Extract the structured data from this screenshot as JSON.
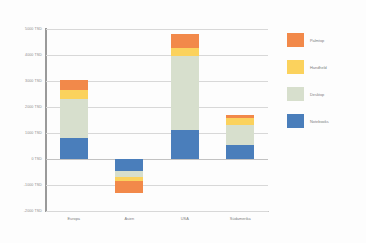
{
  "chart_data": {
    "type": "bar",
    "stacked": true,
    "title": "",
    "xlabel": "",
    "ylabel": "",
    "categories": [
      "Europa",
      "Asien",
      "USA",
      "Südamerika"
    ],
    "series": [
      {
        "name": "Notebooks",
        "color": "#4a7ebb",
        "values": [
          800,
          -450,
          1100,
          550
        ]
      },
      {
        "name": "Desktop",
        "color": "#d7dfcd",
        "values": [
          1500,
          -250,
          2850,
          750
        ]
      },
      {
        "name": "Handheld",
        "color": "#fbd25d",
        "values": [
          350,
          -150,
          320,
          260
        ]
      },
      {
        "name": "Palmtop",
        "color": "#f2894a",
        "values": [
          400,
          -450,
          550,
          140
        ]
      }
    ],
    "ylim": [
      -2000,
      5000
    ],
    "ytick_values": [
      5000,
      4000,
      3000,
      2000,
      1000,
      0,
      -1000,
      -2000
    ],
    "ytick_labels": [
      "5000 TSD",
      "4000 TSD",
      "3000 TSD",
      "2000 TSD",
      "1000 TSD",
      "0 TSD",
      "-1000 TSD",
      "-2000 TSD"
    ],
    "grid": true,
    "legend_position": "right"
  },
  "legend": {
    "entries": [
      {
        "label": "Palmtop",
        "color": "#f2894a"
      },
      {
        "label": "Handheld",
        "color": "#fbd25d"
      },
      {
        "label": "Desktop",
        "color": "#d7dfcd"
      },
      {
        "label": "Notebooks",
        "color": "#4a7ebb"
      }
    ]
  }
}
